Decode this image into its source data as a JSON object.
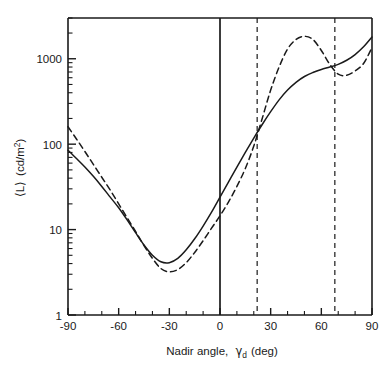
{
  "chart_data": {
    "type": "line",
    "title": "",
    "xlabel": "Nadir angle, γd (deg)",
    "xlabel_parts": {
      "main": "Nadir angle,",
      "symbol": "γ",
      "subscript": "d",
      "unit": "(deg)"
    },
    "ylabel": "⟨L⟩ (cd/m²)",
    "ylabel_parts": {
      "bracketed": "⟨L⟩",
      "unit_main": "(cd/m",
      "unit_sup": "2",
      "unit_close": ")"
    },
    "xlim": [
      -90,
      90
    ],
    "ylim": [
      1,
      3000
    ],
    "yscale": "log",
    "xticks": [
      -90,
      -60,
      -30,
      0,
      30,
      60,
      90
    ],
    "xtick_labels": [
      "-90",
      "-60",
      "-30",
      "0",
      "30",
      "60",
      "90"
    ],
    "xminor_step": 10,
    "yticks": [
      1,
      10,
      100,
      1000
    ],
    "ytick_labels": [
      "1",
      "10",
      "100",
      "1000"
    ],
    "grid": false,
    "legend": null,
    "annotations": {
      "vertical_lines": [
        {
          "name": "nadir-zero-line",
          "x": 0,
          "style": "solid"
        },
        {
          "name": "angle-22-line",
          "x": 22,
          "style": "dashed"
        },
        {
          "name": "angle-68-line",
          "x": 68,
          "style": "dashed"
        }
      ]
    },
    "series": [
      {
        "name": "solid-curve",
        "style": "solid",
        "color": "#1a1a1a",
        "x": [
          -90,
          -85,
          -80,
          -75,
          -70,
          -65,
          -60,
          -55,
          -50,
          -45,
          -40,
          -35,
          -30,
          -25,
          -20,
          -15,
          -10,
          -5,
          0,
          5,
          10,
          15,
          20,
          25,
          30,
          35,
          40,
          45,
          50,
          55,
          60,
          65,
          70,
          75,
          80,
          85,
          90
        ],
        "y": [
          85,
          68,
          54,
          42,
          32,
          24,
          18,
          13.0,
          9.2,
          6.6,
          5.0,
          4.2,
          4.1,
          4.6,
          5.8,
          7.8,
          11.0,
          16.0,
          24.0,
          36.0,
          54.0,
          80.0,
          118,
          170,
          240,
          330,
          430,
          530,
          620,
          690,
          750,
          800,
          860,
          960,
          1120,
          1380,
          1800
        ]
      },
      {
        "name": "dashed-curve",
        "style": "dashed",
        "color": "#1a1a1a",
        "x": [
          -90,
          -85,
          -80,
          -75,
          -70,
          -65,
          -60,
          -55,
          -50,
          -45,
          -40,
          -35,
          -30,
          -25,
          -20,
          -15,
          -10,
          -5,
          0,
          5,
          10,
          15,
          20,
          25,
          30,
          35,
          40,
          45,
          50,
          55,
          60,
          65,
          70,
          75,
          80,
          85,
          90
        ],
        "y": [
          160,
          115,
          82,
          58,
          41,
          29,
          20,
          13.8,
          9.5,
          6.5,
          4.6,
          3.5,
          3.2,
          3.4,
          4.1,
          5.4,
          7.4,
          10.4,
          14.5,
          21.0,
          32.0,
          52.0,
          95.0,
          200,
          430,
          800,
          1300,
          1680,
          1830,
          1680,
          1250,
          860,
          660,
          640,
          720,
          880,
          1350
        ]
      }
    ]
  }
}
